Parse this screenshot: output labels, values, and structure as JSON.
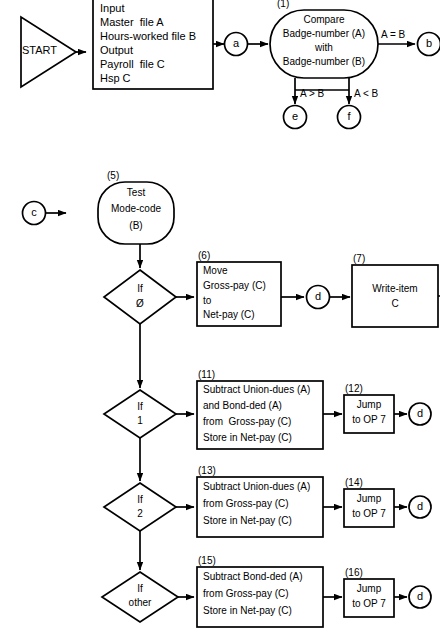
{
  "diagram": {
    "type": "flowchart",
    "stroke_color": "#000000",
    "background_color": "#ffffff"
  },
  "section1": {
    "start": {
      "label": "START",
      "shape": "triangle"
    },
    "io_box": {
      "shape": "rectangle",
      "lines": [
        "Input",
        "Master  file A",
        "Hours-worked file B",
        "Output",
        "Payroll  file C",
        "Hsp C"
      ]
    },
    "connector_a": {
      "label": "a",
      "shape": "circle"
    },
    "compare": {
      "step": "(1)",
      "shape": "oval",
      "lines": [
        "Compare",
        "Badge-number (A)",
        "with",
        "Badge-number (B)"
      ]
    },
    "branches": {
      "equal": {
        "label": "A = B",
        "target": "b"
      },
      "greater": {
        "label": "A > B",
        "target": "e"
      },
      "less": {
        "label": "A < B",
        "target": "f"
      }
    },
    "connector_b": {
      "label": "b",
      "shape": "circle"
    },
    "connector_e": {
      "label": "e",
      "shape": "circle"
    },
    "connector_f": {
      "label": "f",
      "shape": "circle"
    }
  },
  "section2": {
    "connector_c": {
      "label": "c",
      "shape": "circle"
    },
    "test": {
      "step": "(5)",
      "shape": "oval",
      "lines": [
        "Test",
        "Mode-code",
        "(B)"
      ]
    },
    "decisions": [
      {
        "step": "",
        "lines": [
          "If",
          "Ø"
        ],
        "shape": "diamond"
      },
      {
        "step": "",
        "lines": [
          "If",
          "1"
        ],
        "shape": "diamond"
      },
      {
        "step": "",
        "lines": [
          "If",
          "2"
        ],
        "shape": "diamond"
      },
      {
        "step": "",
        "lines": [
          "If",
          "other"
        ],
        "shape": "diamond"
      }
    ],
    "process_boxes": [
      {
        "step": "(6)",
        "shape": "rectangle",
        "lines": [
          "Move",
          "Gross-pay (C)",
          "to",
          "Net-pay (C)"
        ]
      },
      {
        "step": "(11)",
        "shape": "rectangle",
        "lines": [
          "Subtract Union-dues (A)",
          "and Bond-ded (A)",
          "from  Gross-pay (C)",
          "Store in Net-pay (C)"
        ]
      },
      {
        "step": "(13)",
        "shape": "rectangle",
        "lines": [
          "Subtract Union-dues (A)",
          "from Gross-pay (C)",
          "Store in Net-pay (C)"
        ]
      },
      {
        "step": "(15)",
        "shape": "rectangle",
        "lines": [
          "Subtract Bond-ded (A)",
          "from Gross-pay (C)",
          "Store in Net-pay (C)"
        ]
      }
    ],
    "write_item": {
      "step": "(7)",
      "shape": "rectangle",
      "lines": [
        "Write-item",
        "C"
      ]
    },
    "jump_boxes": [
      {
        "step": "(12)",
        "shape": "rectangle",
        "lines": [
          "Jump",
          "to OP 7"
        ]
      },
      {
        "step": "(14)",
        "shape": "rectangle",
        "lines": [
          "Jump",
          "to OP 7"
        ]
      },
      {
        "step": "(16)",
        "shape": "rectangle",
        "lines": [
          "Jump",
          "to OP 7"
        ]
      }
    ],
    "connector_d": {
      "label": "d",
      "shape": "circle"
    }
  }
}
